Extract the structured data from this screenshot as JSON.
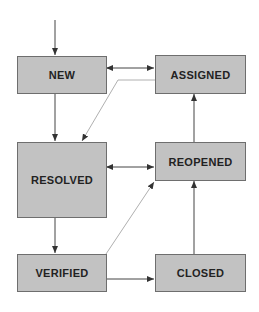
{
  "diagram": {
    "colors": {
      "box_fill": "#c2c2c2",
      "box_border": "#6e6e6e",
      "text": "#222222",
      "arrow": "#333333",
      "dotted": "#b0b0b0"
    },
    "states": {
      "new": "NEW",
      "assigned": "ASSIGNED",
      "resolved": "RESOLVED",
      "reopened": "REOPENED",
      "verified": "VERIFIED",
      "closed": "CLOSED"
    },
    "transitions": [
      {
        "from": "start",
        "to": "NEW",
        "style": "solid"
      },
      {
        "from": "NEW",
        "to": "ASSIGNED",
        "style": "solid",
        "bidirectional": true
      },
      {
        "from": "NEW",
        "to": "RESOLVED",
        "style": "solid"
      },
      {
        "from": "ASSIGNED",
        "to": "RESOLVED",
        "style": "light"
      },
      {
        "from": "RESOLVED",
        "to": "REOPENED",
        "style": "solid",
        "bidirectional": true
      },
      {
        "from": "REOPENED",
        "to": "ASSIGNED",
        "style": "solid"
      },
      {
        "from": "RESOLVED",
        "to": "VERIFIED",
        "style": "solid"
      },
      {
        "from": "VERIFIED",
        "to": "REOPENED",
        "style": "light"
      },
      {
        "from": "VERIFIED",
        "to": "CLOSED",
        "style": "solid"
      },
      {
        "from": "CLOSED",
        "to": "REOPENED",
        "style": "solid"
      }
    ]
  }
}
